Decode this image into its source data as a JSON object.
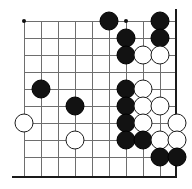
{
  "figure": {
    "kind": "go-board-diagram",
    "board": {
      "columns": 9,
      "rows": 9,
      "origin_x": 24,
      "origin_y": 21,
      "spacing": 17,
      "grid_color": "#6e6e6e",
      "edge_color": "#1a1a1a",
      "background_color": "#ffffff",
      "right_edge_x": 175,
      "bottom_edge_y": 176
    },
    "hoshi_points": [
      {
        "col": 0,
        "row": 0
      },
      {
        "col": 0,
        "row": 6
      },
      {
        "col": 6,
        "row": 0
      }
    ],
    "stones": [
      {
        "color": "black",
        "col": 5,
        "row": 0
      },
      {
        "color": "black",
        "col": 8,
        "row": 0
      },
      {
        "color": "black",
        "col": 6,
        "row": 1
      },
      {
        "color": "black",
        "col": 8,
        "row": 1
      },
      {
        "color": "black",
        "col": 6,
        "row": 2
      },
      {
        "color": "white",
        "col": 7,
        "row": 2
      },
      {
        "color": "white",
        "col": 8,
        "row": 2
      },
      {
        "color": "black",
        "col": 1,
        "row": 4
      },
      {
        "color": "black",
        "col": 6,
        "row": 4
      },
      {
        "color": "white",
        "col": 7,
        "row": 4
      },
      {
        "color": "black",
        "col": 3,
        "row": 5
      },
      {
        "color": "black",
        "col": 6,
        "row": 5
      },
      {
        "color": "white",
        "col": 7,
        "row": 5
      },
      {
        "color": "white",
        "col": 8,
        "row": 5
      },
      {
        "color": "white",
        "col": 0,
        "row": 6
      },
      {
        "color": "black",
        "col": 6,
        "row": 6
      },
      {
        "color": "white",
        "col": 7,
        "row": 6
      },
      {
        "color": "white",
        "col": 9,
        "row": 6
      },
      {
        "color": "white",
        "col": 3,
        "row": 7
      },
      {
        "color": "black",
        "col": 6,
        "row": 7
      },
      {
        "color": "black",
        "col": 7,
        "row": 7
      },
      {
        "color": "white",
        "col": 8,
        "row": 7
      },
      {
        "color": "white",
        "col": 9,
        "row": 7
      },
      {
        "color": "black",
        "col": 8,
        "row": 8
      },
      {
        "color": "black",
        "col": 9,
        "row": 8
      }
    ],
    "stone_colors": {
      "black_fill": "#121212",
      "white_fill": "#ffffff",
      "white_outline": "#1c1c1c"
    }
  }
}
